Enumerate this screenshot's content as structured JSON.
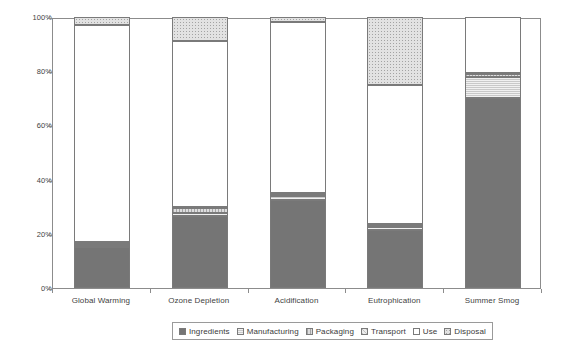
{
  "chart_data": {
    "type": "bar",
    "subtype": "stacked-percentage",
    "title": "",
    "subtitle": "",
    "xlabel": "",
    "ylabel": "",
    "ylim": [
      0,
      100
    ],
    "y_unit": "%",
    "grid": false,
    "legend_position": "bottom",
    "categories": [
      "Global Warming",
      "Ozone Depletion",
      "Acidification",
      "Eutrophication",
      "Summer Smog"
    ],
    "y_ticks": [
      "0%",
      "20%",
      "40%",
      "60%",
      "80%",
      "100%"
    ],
    "y_tick_values": [
      0,
      20,
      40,
      60,
      80,
      100
    ],
    "series": [
      {
        "name": "Ingredients",
        "key": "ingredients",
        "color": "#757575",
        "values": [
          15.0,
          26.5,
          32.5,
          21.5,
          70.0
        ]
      },
      {
        "name": "Manufacturing",
        "key": "manufacturing",
        "color": "#c9c9c9",
        "values": [
          1.0,
          1.0,
          1.5,
          1.0,
          8.0
        ]
      },
      {
        "name": "Packaging",
        "key": "packaging",
        "color": "#ddddde",
        "values": [
          0.5,
          2.0,
          0.5,
          0.5,
          1.0
        ]
      },
      {
        "name": "Transport",
        "key": "transport",
        "color": "#ececec",
        "values": [
          0.5,
          0.5,
          0.5,
          0.5,
          0.5
        ]
      },
      {
        "name": "Use",
        "key": "use",
        "color": "#ffffff",
        "values": [
          80.0,
          61.0,
          63.0,
          51.5,
          20.5
        ]
      },
      {
        "name": "Disposal",
        "key": "disposal",
        "color": "#e2e2e2",
        "values": [
          3.0,
          9.0,
          2.0,
          25.0,
          0.0
        ]
      }
    ]
  },
  "legend": {
    "items": [
      {
        "label": "Ingredients",
        "key": "ingredients"
      },
      {
        "label": "Manufacturing",
        "key": "manufacturing"
      },
      {
        "label": "Packaging",
        "key": "packaging"
      },
      {
        "label": "Transport",
        "key": "transport"
      },
      {
        "label": "Use",
        "key": "use"
      },
      {
        "label": "Disposal",
        "key": "disposal"
      }
    ]
  }
}
